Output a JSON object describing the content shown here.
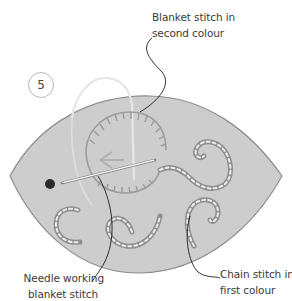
{
  "figure": {
    "step_number": "5",
    "colors": {
      "fabric": "#cfcfcf",
      "fabric_edge": "#8e8e8e",
      "thread_first": "#e8e8e8",
      "thread_second": "#9a9a9a",
      "leader_line": "#1e1e1e",
      "needle": "#ffffff",
      "knot": "#2a2a2a"
    }
  },
  "labels": {
    "blanket_second": {
      "line1": "Blanket stitch in",
      "line2": "second colour"
    },
    "needle_working": {
      "line1": "Needle working",
      "line2": "blanket stitch"
    },
    "chain_first": {
      "line1": "Chain stitch in",
      "line2": "first colour"
    }
  }
}
